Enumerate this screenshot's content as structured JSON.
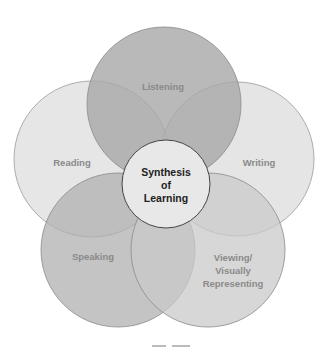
{
  "diagram": {
    "type": "overlapping-circles",
    "center": {
      "lines": [
        "Synthesis",
        "of",
        "Learning"
      ],
      "fill": "#e8e8e8",
      "stroke": "#444444"
    },
    "circles": [
      {
        "label_lines": [
          "Listening"
        ],
        "fill": "#a8a8a8",
        "opacity": 0.8
      },
      {
        "label_lines": [
          "Reading"
        ],
        "fill": "#dedede",
        "opacity": 0.75
      },
      {
        "label_lines": [
          "Writing"
        ],
        "fill": "#dcdcdc",
        "opacity": 0.75
      },
      {
        "label_lines": [
          "Speaking"
        ],
        "fill": "#b0b0b0",
        "opacity": 0.75
      },
      {
        "label_lines": [
          "Viewing/",
          "Visually",
          "Representing"
        ],
        "fill": "#cacaca",
        "opacity": 0.75
      }
    ],
    "caption_partial": "Figure ..."
  }
}
